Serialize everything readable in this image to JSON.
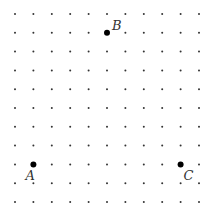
{
  "diagram": {
    "type": "dot-grid",
    "grid": {
      "columns": 11,
      "rows": 11,
      "origin_x": 15,
      "origin_y": 14,
      "spacing_x": 18.4,
      "spacing_y": 18.8,
      "dot_radius": 1,
      "dot_color": "#333333"
    },
    "points": [
      {
        "label": "A",
        "col": 1,
        "row": 8,
        "label_dx": -8,
        "label_dy": 16
      },
      {
        "label": "B",
        "col": 5,
        "row": 1,
        "label_dx": 5,
        "label_dy": -3
      },
      {
        "label": "C",
        "col": 9,
        "row": 8,
        "label_dx": 3,
        "label_dy": 16
      }
    ],
    "point_radius": 3,
    "point_color": "#000000"
  }
}
